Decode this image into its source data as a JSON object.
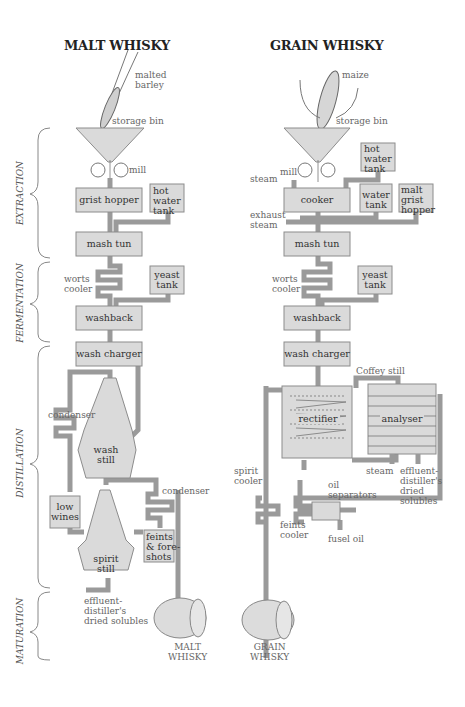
{
  "titles": {
    "malt": "MALT WHISKY",
    "grain": "GRAIN WHISKY"
  },
  "stages": [
    "EXTRACTION",
    "FERMENTATION",
    "DISTILLATION",
    "MATURATION"
  ],
  "malt": {
    "raw": "malted\nbarley",
    "storage_bin": "storage bin",
    "mill": "mill",
    "grist_hopper": "grist hopper",
    "hot_water_tank": "hot\nwater\ntank",
    "mash_tun": "mash tun",
    "worts_cooler": "worts\ncooler",
    "yeast_tank": "yeast\ntank",
    "washback": "washback",
    "wash_charger": "wash charger",
    "condenser1": "condenser",
    "wash_still": "wash\nstill",
    "low_wines": "low\nwines",
    "condenser2": "condenser",
    "feints": "feints\n& fore-\nshots",
    "spirit_still": "spirit\nstill",
    "effluent": "effluent-\ndistiller's\ndried solubles",
    "product": "MALT\nWHISKY"
  },
  "grain": {
    "raw": "maize",
    "storage_bin": "storage bin",
    "mill": "mill",
    "steam": "steam",
    "hot_water_tank": "hot\nwater\ntank",
    "cooker": "cooker",
    "water_tank": "water\ntank",
    "malt_grist_hopper": "malt\ngrist\nhopper",
    "exhaust_steam": "exhaust\nsteam",
    "mash_tun": "mash tun",
    "worts_cooler": "worts\ncooler",
    "yeast_tank": "yeast\ntank",
    "washback": "washback",
    "wash_charger": "wash charger",
    "coffey_still": "Coffey still",
    "rectifier": "rectifier",
    "analyser": "analyser",
    "spirit_cooler": "spirit\ncooler",
    "steam2": "steam",
    "effluent": "effluent-\ndistiller's\ndried\nsolubles",
    "oil_separators": "oil\nseparators",
    "feints_cooler": "feints\ncooler",
    "fusel_oil": "fusel oil",
    "product": "GRAIN\nWHISKY"
  },
  "colors": {
    "fill": "#d9d9d9",
    "stroke": "#8a8a8a",
    "text": "#444444"
  }
}
